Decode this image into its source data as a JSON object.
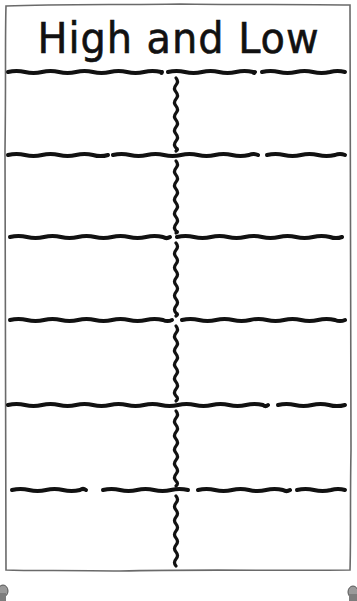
{
  "worksheet": {
    "title": "High and Low",
    "columns": [
      "",
      ""
    ],
    "rows": [
      [
        "",
        ""
      ],
      [
        "",
        ""
      ],
      [
        "",
        ""
      ],
      [
        "",
        ""
      ],
      [
        "",
        ""
      ],
      [
        "",
        ""
      ]
    ]
  },
  "colors": {
    "ink": "#111111",
    "frame": "#6a6a6a",
    "paper": "#ffffff",
    "pin": "#8a8a8a"
  }
}
